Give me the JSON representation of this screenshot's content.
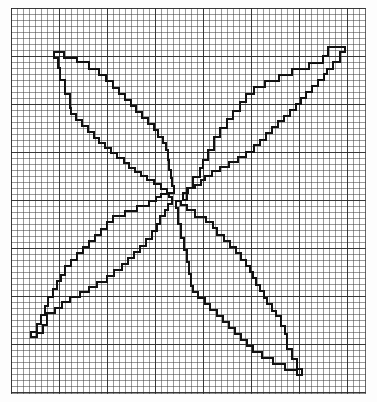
{
  "figure": {
    "title": "Four-petal stepped outline on graph paper",
    "background": "#ffffff",
    "line_color": "#111111",
    "grid": {
      "cell_px": 6,
      "major_every_cells": 8,
      "left": 11,
      "top": 8,
      "width": 354,
      "height": 385,
      "minor_color": "#8c8c8c",
      "major_color": "#282828"
    },
    "center": {
      "x": 178,
      "y": 200
    },
    "petals": [
      {
        "name": "upper-left",
        "tip": {
          "x": 54,
          "y": 52
        },
        "points": "54,52 64,52 64,58 77,58 77,62 89,62 89,69 99,69 99,75 106,75 106,81 113,81 113,88 119,88 119,94 125,94 125,100 131,100 131,106 136,106 136,112 142,112 142,118 148,118 148,124 154,124 154,130 158,130 158,137 163,137 163,143 166,143 166,150 168,150 168,160 169,160 169,170 171,170 171,178 172,178 172,186 174,186 174,193 167,193 167,189 161,189 161,184 154,184 154,180 147,180 147,176 141,176 141,172 135,172 135,168 129,168 129,163 124,163 124,158 117,158 117,153 111,153 111,148 105,148 105,143 99,143 99,138 94,138 94,132 88,132 88,126 82,126 82,120 76,120 76,114 71,114 71,108 70,108 70,94 65,94 65,80 60,80 60,68 58,68 58,58 54,58 54,52"
      },
      {
        "name": "upper-right",
        "tip": {
          "x": 345,
          "y": 47
        },
        "points": "345,47 345,52 340,52 340,62 333,62 333,69 327,69 327,74 324,74 324,80 318,80 318,86 312,86 312,92 306,92 306,98 301,98 301,104 296,104 296,110 290,110 290,116 284,116 284,121 278,121 278,127 272,127 272,133 266,133 266,140 260,140 260,145 254,145 254,152 246,152 246,157 238,157 238,162 229,162 229,167 220,167 220,171 212,171 212,176 205,176 205,180 201,180 201,185 195,185 195,188 188,188 188,193 183,193 183,200 187,200 187,188 193,188 193,177 200,177 200,168 203,168 203,160 208,160 208,150 214,150 214,137 220,137 220,128 227,128 227,119 233,119 233,111 240,111 240,102 246,102 246,94 254,94 254,87 265,87 265,81 279,81 279,75 292,75 292,69 309,69 309,63 323,63 323,56 328,56 328,47 345,47"
      },
      {
        "name": "lower-left",
        "tip": {
          "x": 31,
          "y": 337
        },
        "points": "31,337 31,332 37,332 37,324 41,324 41,315 45,315 45,306 48,306 48,297 53,297 53,289 57,289 57,281 61,281 61,275 65,275 65,266 71,266 71,260 77,260 77,253 83,253 83,247 89,247 89,241 95,241 95,235 101,235 101,229 107,229 107,222 113,222 113,216 125,216 125,211 137,211 137,206 149,206 149,201 156,201 156,197 161,197 161,194 169,194 169,197 172,197 172,204 168,204 168,210 165,210 165,216 160,216 160,224 157,224 157,231 152,231 152,239 146,239 146,246 140,246 140,252 134,252 134,258 128,258 128,264 122,264 122,270 114,270 114,276 107,276 107,282 97,282 97,287 89,287 89,292 80,292 80,297 70,297 70,302 62,302 62,308 55,308 55,313 47,313 47,325 43,325 43,333 37,333 37,337 31,337"
      },
      {
        "name": "lower-right",
        "tip": {
          "x": 302,
          "y": 375
        },
        "points": "302,375 297,375 297,370 285,370 285,364 273,364 273,358 262,358 262,352 253,352 253,346 247,346 247,340 241,340 241,334 235,334 235,328 229,328 229,322 223,322 223,316 217,316 217,310 210,310 210,304 205,304 205,298 198,298 198,292 193,292 193,286 191,286 191,274 189,274 189,262 187,262 187,250 184,250 184,238 181,238 181,224 178,224 178,208 176,208 176,201 181,201 181,205 187,205 187,210 195,210 195,217 206,217 206,222 213,222 213,228 217,228 217,235 224,235 224,241 230,241 230,247 236,247 236,253 241,253 241,260 246,260 246,266 250,266 250,272 253,272 253,278 256,278 256,285 260,285 260,291 264,291 264,298 267,298 267,304 272,304 272,311 276,311 276,316 281,316 281,326 285,326 285,334 287,334 287,349 292,349 292,359 297,359 297,369 302,369 302,375"
      }
    ]
  }
}
